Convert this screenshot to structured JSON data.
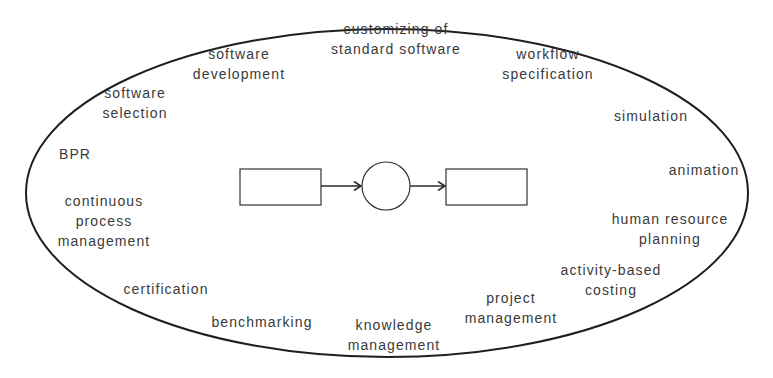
{
  "diagram": {
    "central_process": {
      "input_box": "",
      "function_circle": "",
      "output_box": ""
    },
    "labels": [
      {
        "id": "software-development",
        "line1": "software",
        "line2": "development",
        "x": 239,
        "y": 44
      },
      {
        "id": "customizing-standard-software",
        "line1": "customizing of",
        "line2": "standard software",
        "x": 396,
        "y": 19
      },
      {
        "id": "workflow-specification",
        "line1": "workflow",
        "line2": "specification",
        "x": 548,
        "y": 44
      },
      {
        "id": "software-selection",
        "line1": "software",
        "line2": "selection",
        "x": 135,
        "y": 83
      },
      {
        "id": "simulation",
        "line1": "simulation",
        "line2": "",
        "x": 651,
        "y": 106
      },
      {
        "id": "bpr",
        "line1": "BPR",
        "line2": "",
        "x": 75,
        "y": 144
      },
      {
        "id": "animation",
        "line1": "animation",
        "line2": "",
        "x": 704,
        "y": 160
      },
      {
        "id": "continuous-process-management",
        "line1": "continuous",
        "line2": "process",
        "line3": "management",
        "x": 104,
        "y": 191
      },
      {
        "id": "human-resource-planning",
        "line1": "human resource",
        "line2": "planning",
        "x": 670,
        "y": 209
      },
      {
        "id": "activity-based-costing",
        "line1": "activity-based",
        "line2": "costing",
        "x": 611,
        "y": 260
      },
      {
        "id": "certification",
        "line1": "certification",
        "line2": "",
        "x": 166,
        "y": 279
      },
      {
        "id": "project-management",
        "line1": "project",
        "line2": "management",
        "x": 511,
        "y": 288
      },
      {
        "id": "benchmarking",
        "line1": "benchmarking",
        "line2": "",
        "x": 262,
        "y": 312
      },
      {
        "id": "knowledge-management",
        "line1": "knowledge",
        "line2": "management",
        "x": 394,
        "y": 315
      }
    ]
  }
}
